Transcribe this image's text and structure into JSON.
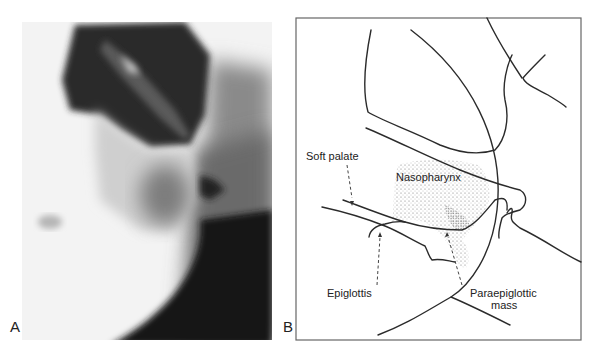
{
  "figure": {
    "panels": [
      {
        "letter": "A",
        "type": "radiograph",
        "description": "Lateral radiograph of neck/pharynx region"
      },
      {
        "letter": "B",
        "type": "line-diagram",
        "labels": {
          "soft_palate": "Soft palate",
          "nasopharynx": "Nasopharynx",
          "epiglottis": "Epiglottis",
          "paraepiglottic_line1": "Paraepiglottic",
          "paraepiglottic_line2": "mass"
        }
      }
    ]
  }
}
